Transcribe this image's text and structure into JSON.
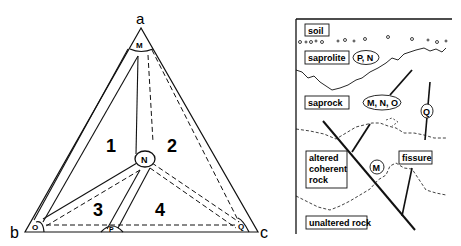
{
  "left_diagram": {
    "vertices": {
      "a": "a",
      "b": "b",
      "c": "c"
    },
    "nodes": {
      "top": "M",
      "center": "N",
      "bottom_left": "O",
      "bottom_mid": "P",
      "bottom_right": "Q"
    },
    "regions": [
      "1",
      "2",
      "3",
      "4"
    ]
  },
  "right_diagram": {
    "layers": {
      "soil": "soil",
      "saprolite": "saprolite",
      "saprock": "saprock",
      "altered_line1": "altered",
      "altered_line2": "coherent",
      "altered_line3": "rock",
      "unaltered": "unaltered rock"
    },
    "tags": {
      "saprolite": "P, N",
      "saprock": "M, N, O",
      "fissure_q": "Q",
      "altered_m": "M"
    },
    "fissure_label": "fissure"
  }
}
